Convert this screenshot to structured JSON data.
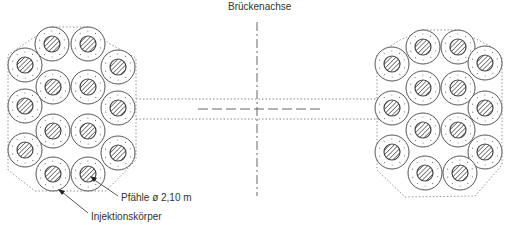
{
  "labels": {
    "axis_title": "Brückenachse",
    "piles": "Pfähle  ø 2,10 m",
    "grout": "Injektionskörper"
  },
  "colors": {
    "line": "#555555",
    "hatch": "#444444",
    "dots": "#777777"
  },
  "groups": [
    {
      "name": "left-pile-group",
      "piles": [
        [
          52,
          44
        ],
        [
          88,
          44
        ],
        [
          25,
          65
        ],
        [
          118,
          67
        ],
        [
          53,
          87
        ],
        [
          88,
          87
        ],
        [
          25,
          106
        ],
        [
          118,
          108
        ],
        [
          53,
          131
        ],
        [
          88,
          131
        ],
        [
          25,
          150
        ],
        [
          118,
          153
        ],
        [
          53,
          174
        ],
        [
          88,
          174
        ]
      ],
      "outline": [
        [
          52,
          27
        ],
        [
          88,
          27
        ],
        [
          110,
          44
        ],
        [
          136,
          58
        ],
        [
          136,
          160
        ],
        [
          106,
          191
        ],
        [
          35,
          191
        ],
        [
          8,
          170
        ],
        [
          8,
          55
        ],
        [
          30,
          40
        ]
      ]
    },
    {
      "name": "right-pile-group",
      "piles": [
        [
          423,
          47
        ],
        [
          458,
          47
        ],
        [
          392,
          64
        ],
        [
          485,
          63
        ],
        [
          423,
          88
        ],
        [
          458,
          88
        ],
        [
          392,
          108
        ],
        [
          485,
          108
        ],
        [
          423,
          130
        ],
        [
          458,
          130
        ],
        [
          392,
          152
        ],
        [
          485,
          152
        ],
        [
          425,
          173
        ],
        [
          460,
          173
        ]
      ],
      "outline": [
        [
          423,
          30
        ],
        [
          458,
          30
        ],
        [
          490,
          46
        ],
        [
          502,
          58
        ],
        [
          502,
          165
        ],
        [
          475,
          196
        ],
        [
          405,
          197
        ],
        [
          377,
          170
        ],
        [
          377,
          55
        ],
        [
          400,
          40
        ]
      ]
    }
  ],
  "pile_dims": {
    "outer_r": 17,
    "inner_r": 8
  }
}
